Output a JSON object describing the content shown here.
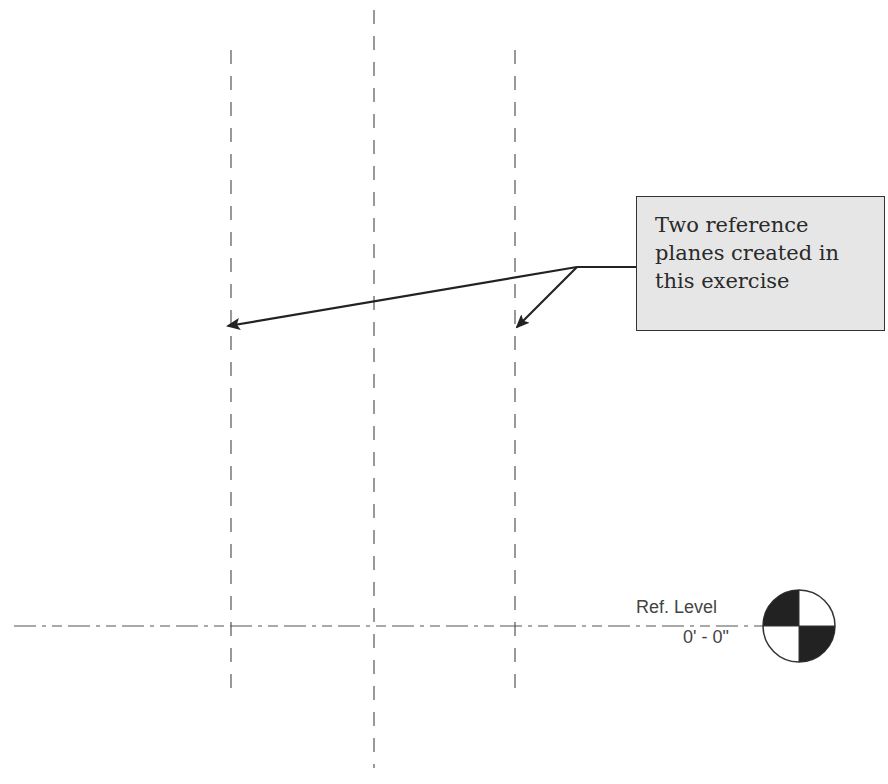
{
  "drawing": {
    "reference_planes": [
      {
        "id": "ref-plane-left",
        "x": 231,
        "y_start": 50,
        "y_end": 695,
        "created_in_exercise": true
      },
      {
        "id": "ref-plane-center",
        "x": 374,
        "y_start": 10,
        "y_end": 768,
        "created_in_exercise": false
      },
      {
        "id": "ref-plane-right",
        "x": 515,
        "y_start": 50,
        "y_end": 695,
        "created_in_exercise": true
      }
    ],
    "level_line": {
      "y": 626,
      "x_start": 14,
      "x_end": 790
    }
  },
  "callout": {
    "lines": [
      "Two reference",
      "planes created in",
      "this exercise"
    ],
    "fill_color": "#e6e6e6",
    "border_color": "#333333"
  },
  "level": {
    "name": "Ref. Level",
    "elevation": "0' - 0\""
  },
  "colors": {
    "line": "#555555",
    "arrow": "#222222",
    "marker_fill": "#222222"
  }
}
